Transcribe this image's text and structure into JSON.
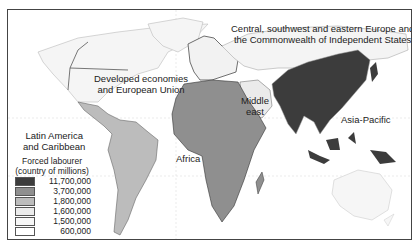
{
  "map": {
    "regions": [
      {
        "id": "central-eastern-europe-cis",
        "label_line1": "Central, southwest and eastern Europe and",
        "label_line2": "the Commonwealth of Independent States",
        "shade": "#f4f4f4"
      },
      {
        "id": "developed-economies-eu",
        "label_line1": "Developed economies",
        "label_line2": "and European Union",
        "shade": "#f7f7f7"
      },
      {
        "id": "middle-east",
        "label_line1": "Middle",
        "label_line2": "east",
        "shade": "#ebebeb"
      },
      {
        "id": "asia-pacific",
        "label_line1": "Asia-Pacific",
        "shade": "#3c3c3c"
      },
      {
        "id": "latin-america-caribbean",
        "label_line1": "Latin America",
        "label_line2": "and Caribbean",
        "shade": "#bcbcbc"
      },
      {
        "id": "africa",
        "label_line1": "Africa",
        "shade": "#8f8f8f"
      }
    ]
  },
  "legend": {
    "title_line1": "Forced labourer",
    "title_line2": "(country of millions)",
    "items": [
      {
        "value": "11,700,000",
        "color": "#3c3c3c"
      },
      {
        "value": "3,700,000",
        "color": "#8f8f8f"
      },
      {
        "value": "1,800,000",
        "color": "#bcbcbc"
      },
      {
        "value": "1,600,000",
        "color": "#ebebeb"
      },
      {
        "value": "1,500,000",
        "color": "#f7f7f7"
      },
      {
        "value": "600,000",
        "color": "#ffffff"
      }
    ]
  }
}
